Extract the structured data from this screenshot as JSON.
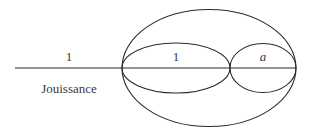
{
  "diagram": {
    "labels": {
      "left_segment": "1",
      "left_caption": "Jouissance",
      "inner_left_ellipse": "1",
      "inner_right_ellipse": "a"
    },
    "colors": {
      "stroke": "#2a2a2a",
      "text": "#3a3a3a",
      "background": "#ffffff"
    }
  }
}
